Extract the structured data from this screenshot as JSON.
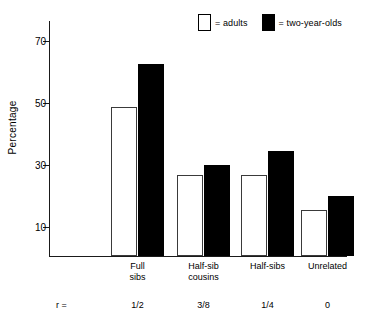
{
  "chart_data": {
    "type": "bar",
    "title": "",
    "xlabel": "",
    "ylabel": "Percentage",
    "ylim": [
      0,
      70
    ],
    "yticks": [
      70,
      50,
      30,
      10
    ],
    "ytick_labels": [
      "70",
      "50",
      "30",
      "10"
    ],
    "grid": false,
    "legend_position": "top-right",
    "categories": [
      "Full\nsibs",
      "Half-sib\ncousins",
      "Half-sibs",
      "Unrelated"
    ],
    "category_lines": [
      [
        "Full",
        "sibs"
      ],
      [
        "Half-sib",
        "cousins"
      ],
      [
        "Half-sibs"
      ],
      [
        "Unrelated"
      ]
    ],
    "series": [
      {
        "name": "adults",
        "color": "#ffffff",
        "edge_color": "#3a3a3a",
        "values": [
          48,
          26,
          26,
          15
        ]
      },
      {
        "name": "two-year-olds",
        "color": "#000000",
        "edge_color": "#000000",
        "values": [
          62,
          29.5,
          34,
          19.5
        ]
      }
    ],
    "annotations": {
      "r_row_label": "r =",
      "r_values": [
        "1/2",
        "3/8",
        "1/4",
        "0"
      ]
    }
  },
  "legend": {
    "entries": [
      {
        "swatch": "open-square-swatch",
        "label": "= adults"
      },
      {
        "swatch": "filled-square-swatch",
        "label": "= two-year-olds"
      }
    ]
  },
  "axis": {
    "y_label": "Percentage"
  }
}
